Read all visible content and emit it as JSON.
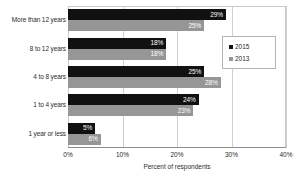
{
  "chart_data": {
    "type": "bar",
    "orientation": "horizontal",
    "title": "",
    "xlabel": "Percent of respondents",
    "ylabel": "",
    "xlim": [
      0,
      40
    ],
    "xticks": [
      "0%",
      "10%",
      "20%",
      "30%",
      "40%"
    ],
    "xtick_values": [
      0,
      10,
      20,
      30,
      40
    ],
    "grid": true,
    "legend_position": "right",
    "categories": [
      "More than 12 years",
      "8 to 12 years",
      "4 to 8 years",
      "1 to 4 years",
      "1 year or less"
    ],
    "series": [
      {
        "name": "2015",
        "color": "#111111",
        "values": [
          29,
          18,
          25,
          24,
          5
        ],
        "labels": [
          "29%",
          "18%",
          "25%",
          "24%",
          "5%"
        ]
      },
      {
        "name": "2013",
        "color": "#969696",
        "values": [
          25,
          18,
          28,
          23,
          6
        ],
        "labels": [
          "25%",
          "18%",
          "28%",
          "23%",
          "6%"
        ]
      }
    ]
  }
}
